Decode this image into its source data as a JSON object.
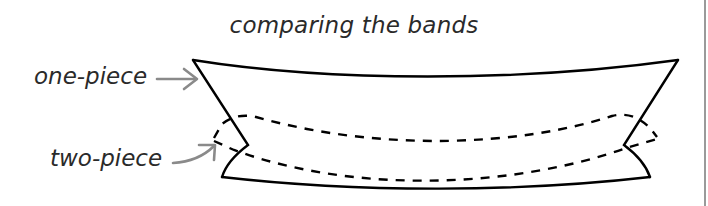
{
  "diagram": {
    "title": "comparing the bands",
    "labels": [
      {
        "id": "one-piece",
        "text": "one-piece",
        "pointer": "straight-arrow",
        "target": "solid-outline-band"
      },
      {
        "id": "two-piece",
        "text": "two-piece",
        "pointer": "curved-arrow",
        "target": "dashed-outline-band"
      }
    ],
    "shapes": {
      "one_piece_band": {
        "style": "solid",
        "color": "#000000"
      },
      "two_piece_band": {
        "style": "dashed",
        "color": "#000000"
      }
    },
    "arrow_color": "#8a8a8a",
    "right_rule_color": "#9a9a9a"
  }
}
